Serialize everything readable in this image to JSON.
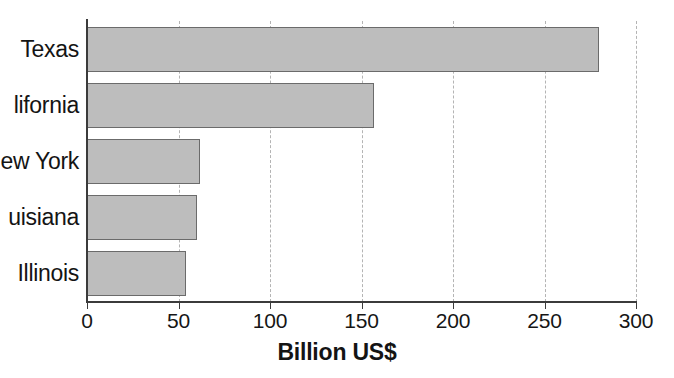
{
  "chart_data": {
    "type": "bar",
    "orientation": "horizontal",
    "title": "",
    "xlabel": "Billion US$",
    "ylabel": "",
    "categories": [
      "Texas",
      "California",
      "New York",
      "Louisiana",
      "Illinois"
    ],
    "values": [
      280,
      157,
      62,
      60,
      54
    ],
    "xlim": [
      0,
      300
    ],
    "xticks": [
      0,
      50,
      100,
      150,
      200,
      250,
      300
    ],
    "xtick_labels": [
      "0",
      "50",
      "100",
      "150",
      "200",
      "250",
      "300"
    ],
    "grid": "vertical-dashed",
    "legend": "none",
    "bar_fill_color": "#bdbdbd",
    "bar_border_color": "#6b6b6b",
    "axis_color": "#3b3b3b",
    "gridline_color": "#b4b4b4"
  },
  "axis": {
    "x_title": "Billion US$"
  },
  "categories_rendered": [
    {
      "label": "Texas",
      "clipped": false
    },
    {
      "label": "lifornia",
      "clipped": true
    },
    {
      "label": "ew York",
      "clipped": true
    },
    {
      "label": "uisiana",
      "clipped": true
    },
    {
      "label": "Illinois",
      "clipped": false
    }
  ]
}
